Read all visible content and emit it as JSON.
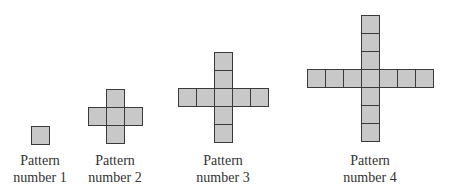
{
  "diagram": {
    "type": "growing-cross-patterns",
    "cell_size_px": 18,
    "colors": {
      "fill": "#c8c8c8",
      "stroke": "#3a3a3a",
      "text": "#333333"
    },
    "patterns": [
      {
        "line1": "Pattern",
        "line2": "number 1",
        "arm_length": 0,
        "squares": 1,
        "center_x": 40,
        "center_y": 135
      },
      {
        "line1": "Pattern",
        "line2": "number 2",
        "arm_length": 1,
        "squares": 5,
        "center_x": 115,
        "center_y": 116
      },
      {
        "line1": "Pattern",
        "line2": "number 3",
        "arm_length": 2,
        "squares": 9,
        "center_x": 223,
        "center_y": 97
      },
      {
        "line1": "Pattern",
        "line2": "number 4",
        "arm_length": 3,
        "squares": 13,
        "center_x": 370,
        "center_y": 78
      }
    ]
  }
}
